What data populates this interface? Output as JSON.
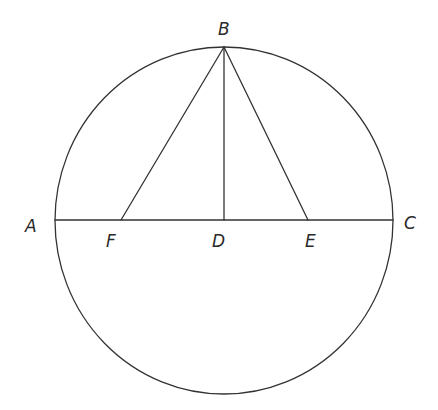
{
  "diagram": {
    "type": "geometry",
    "stroke_color": "#333333",
    "label_color": "#2a2a2a",
    "circle": {
      "cx": 224,
      "cy": 220.5,
      "rx": 169,
      "ry": 173.5
    },
    "points": {
      "A": {
        "x": 55,
        "y": 220
      },
      "B": {
        "x": 224,
        "y": 47
      },
      "C": {
        "x": 393,
        "y": 220
      },
      "D": {
        "x": 224,
        "y": 220
      },
      "E": {
        "x": 308,
        "y": 220
      },
      "F": {
        "x": 121,
        "y": 220
      }
    },
    "segments": [
      {
        "from": "A",
        "to": "C"
      },
      {
        "from": "B",
        "to": "F"
      },
      {
        "from": "B",
        "to": "D"
      },
      {
        "from": "B",
        "to": "E"
      }
    ],
    "labels": {
      "A": {
        "text": "A",
        "x": 25,
        "y": 232
      },
      "B": {
        "text": "B",
        "x": 218,
        "y": 35
      },
      "C": {
        "text": "C",
        "x": 404,
        "y": 229
      },
      "D": {
        "text": "D",
        "x": 212,
        "y": 247
      },
      "E": {
        "text": "E",
        "x": 305,
        "y": 247
      },
      "F": {
        "text": "F",
        "x": 106,
        "y": 247
      }
    }
  }
}
